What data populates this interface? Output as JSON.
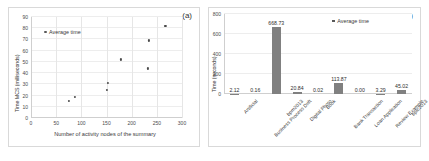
{
  "figure": {
    "panel_a_tag": "(a)",
    "panel_b_tag": "(b)"
  },
  "chart_data": [
    {
      "type": "scatter",
      "panel": "(a)",
      "title": "",
      "xlabel": "Number of activity nodes of the summary",
      "ylabel": "Time MCS (milliseconds)",
      "xlim": [
        0,
        300
      ],
      "ylim": [
        0,
        90
      ],
      "xticks": [
        "0",
        "50",
        "100",
        "150",
        "200",
        "250",
        "300"
      ],
      "yticks": [
        "0",
        "10",
        "20",
        "30",
        "40",
        "50",
        "60",
        "70",
        "80",
        "90"
      ],
      "grid": true,
      "legend": [
        "Average time"
      ],
      "legend_position": "top-left",
      "series": [
        {
          "name": "Average time",
          "points": [
            {
              "x": 75,
              "y": 15
            },
            {
              "x": 88,
              "y": 19
            },
            {
              "x": 150,
              "y": 25
            },
            {
              "x": 153,
              "y": 31
            },
            {
              "x": 178,
              "y": 52
            },
            {
              "x": 232,
              "y": 44
            },
            {
              "x": 234,
              "y": 69
            },
            {
              "x": 267,
              "y": 82
            }
          ]
        }
      ]
    },
    {
      "type": "bar",
      "panel": "(b)",
      "title": "",
      "xlabel": "",
      "ylabel": "Time (seconds)",
      "ylim": [
        0,
        800
      ],
      "yticks": [
        "0",
        "200",
        "400",
        "600",
        "800"
      ],
      "grid": true,
      "legend": [
        "Average time"
      ],
      "legend_position": "top-right",
      "categories": [
        "Artificial",
        "Business Process Drift",
        "bpm2013",
        "Digital Photo",
        "Book",
        "Bank Transaction",
        "Loan Application",
        "Review Example",
        "bpic2013"
      ],
      "values": [
        2.12,
        0.16,
        668.73,
        20.84,
        0.02,
        113.87,
        0.0,
        3.29,
        45.02
      ],
      "value_labels": [
        "2.12",
        "0.16",
        "668.73",
        "20.84",
        "0.02",
        "113.87",
        "0.00",
        "3.29",
        "45.02"
      ],
      "bar_color": "#808080"
    }
  ],
  "colors": {
    "bar": "#808080",
    "marker": "#4a4a4a",
    "grid": "#e6e6e6",
    "axis": "#cfcfcf",
    "text": "#3a3a3a"
  }
}
